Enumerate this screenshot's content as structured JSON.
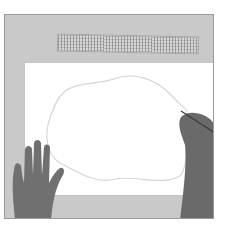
{
  "image": {
    "description": "Grayscale photo: a left hand resting on white paper while the right hand traces a wavy closed outline with a pencil; a ruler lies on the gray table above the paper",
    "colors": {
      "background": "#ffffff",
      "table": "#c9c9c9",
      "paper": "#ffffff",
      "skin": "#6e6e6e",
      "outline": "#d9d9d9"
    },
    "objects": [
      "table",
      "ruler",
      "paper",
      "traced-outline",
      "left-hand",
      "right-hand-with-pencil"
    ]
  }
}
